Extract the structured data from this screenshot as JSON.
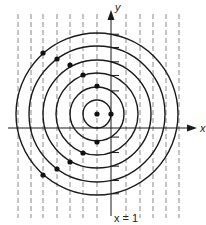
{
  "diagram": {
    "type": "level-curves-with-vertical-lines",
    "center": {
      "px": 97,
      "py": 114
    },
    "unit_px": 13.6,
    "circle_radii_px": [
      14,
      27,
      41,
      54,
      68,
      81
    ],
    "dashed_lines_x_px": [
      18,
      31,
      43,
      57,
      70,
      83,
      97,
      126,
      140,
      153,
      166,
      179
    ],
    "axis": {
      "x_axis_y_px": 128,
      "y_axis_x_px": 111,
      "x_label": "x",
      "y_label": "y"
    },
    "vertical_line_label": "x = 1",
    "points": [
      {
        "x": 97,
        "y": 114
      },
      {
        "x": 111,
        "y": 114
      },
      {
        "x": 97,
        "y": 86
      },
      {
        "x": 83,
        "y": 75
      },
      {
        "x": 70,
        "y": 65
      },
      {
        "x": 57,
        "y": 59
      },
      {
        "x": 43,
        "y": 53
      },
      {
        "x": 97,
        "y": 142
      },
      {
        "x": 83,
        "y": 153
      },
      {
        "x": 70,
        "y": 162
      },
      {
        "x": 57,
        "y": 169
      },
      {
        "x": 43,
        "y": 175
      }
    ],
    "colors": {
      "stroke": "#1a1a1a",
      "dashed": "#8a8a8a",
      "point": "#111111"
    }
  }
}
